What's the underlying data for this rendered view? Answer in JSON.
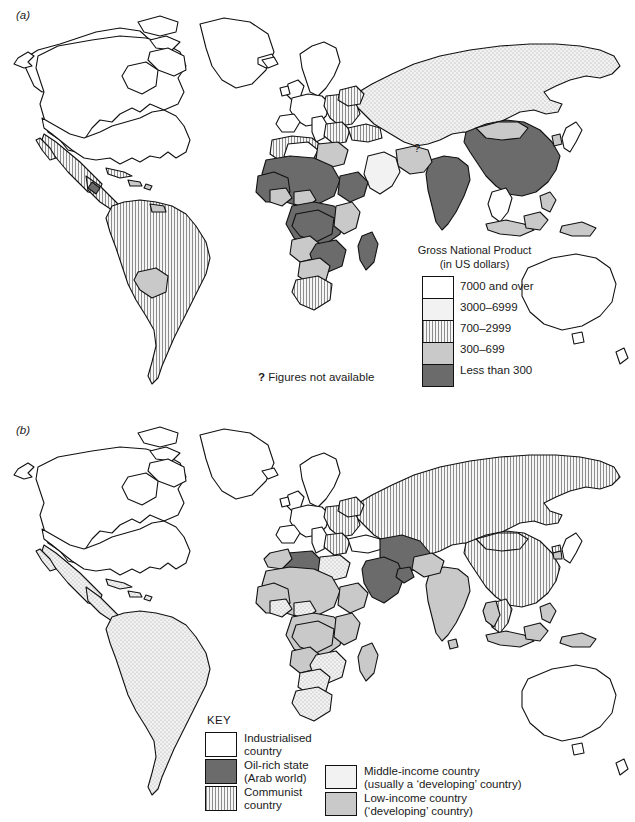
{
  "figure": {
    "panels": [
      {
        "id": "a",
        "label": "(a)"
      },
      {
        "id": "b",
        "label": "(b)"
      }
    ]
  },
  "map_a": {
    "label": "(a)",
    "legend": {
      "title_line1": "Gross National Product",
      "title_line2": "(in US dollars)",
      "classes": [
        {
          "label": "7000 and over",
          "pattern": "white",
          "color": "#ffffff"
        },
        {
          "label": "3000–6999",
          "pattern": "dotted",
          "color": "#f2f2f2"
        },
        {
          "label": "700–2999",
          "pattern": "vertical-stripes",
          "color": "#f4f4f4"
        },
        {
          "label": "300–699",
          "pattern": "light-grey",
          "color": "#c9c9c9"
        },
        {
          "label": "Less than 300",
          "pattern": "dark-grey",
          "color": "#6b6b6b"
        }
      ],
      "note_symbol": "?",
      "note_text": "Figures not available"
    }
  },
  "map_b": {
    "label": "(b)",
    "legend": {
      "title": "KEY",
      "column_left": [
        {
          "line1": "Industrialised",
          "line2": "country",
          "pattern": "white",
          "color": "#ffffff"
        },
        {
          "line1": "Oil-rich state",
          "line2": "(Arab world)",
          "pattern": "dark-grey",
          "color": "#6b6b6b"
        },
        {
          "line1": "Communist",
          "line2": "country",
          "pattern": "vertical-stripes",
          "color": "#f4f4f4"
        }
      ],
      "column_right": [
        {
          "line1": "Middle-income country",
          "line2": "(usually a ‘developing’ country)",
          "pattern": "dotted",
          "color": "#f2f2f2"
        },
        {
          "line1": "Low-income country",
          "line2": "(‘developing’ country)",
          "pattern": "light-grey",
          "color": "#c9c9c9"
        }
      ]
    }
  },
  "marks": {
    "question_mark_a": "?"
  }
}
